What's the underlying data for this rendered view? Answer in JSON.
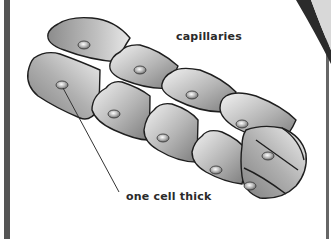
{
  "figure": {
    "labels": {
      "capillaries": "capillaries",
      "one_cell_thick": "one cell thick"
    },
    "colors": {
      "background": "#ffffff",
      "border": "#555555",
      "outline": "#1e1e1e",
      "cell_dark": "#8a8a8a",
      "cell_light": "#efefef",
      "top_right_band": "#2b2b2b"
    }
  }
}
